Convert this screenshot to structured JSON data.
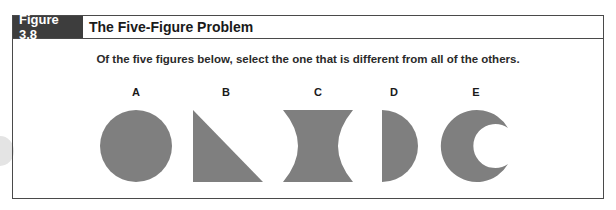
{
  "figure": {
    "label": "Figure 3.8",
    "title": "The Five-Figure Problem",
    "instruction": "Of the five figures below, select the one that is different from all of the others."
  },
  "shapes": [
    {
      "label": "A",
      "kind": "circle"
    },
    {
      "label": "B",
      "kind": "right-triangle"
    },
    {
      "label": "C",
      "kind": "concave-hourglass"
    },
    {
      "label": "D",
      "kind": "semicircle"
    },
    {
      "label": "E",
      "kind": "crescent"
    }
  ],
  "colors": {
    "shape_fill": "#7f7f7f",
    "label_bg": "#3d3d3d",
    "border": "#4a4a4a"
  }
}
